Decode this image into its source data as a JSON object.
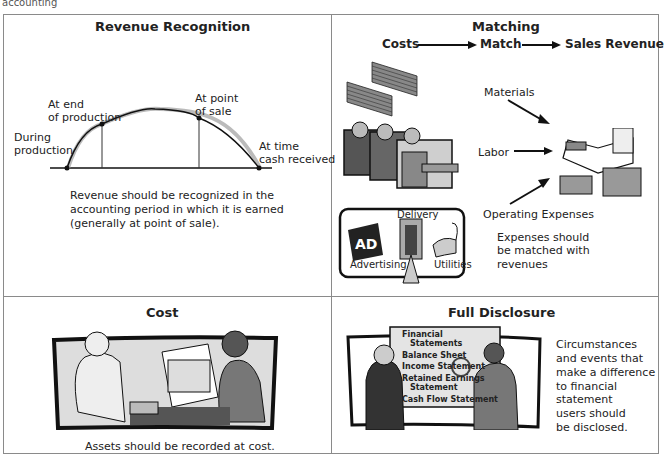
{
  "caption": "accounting",
  "revenue_recognition": {
    "title": "Revenue Recognition",
    "points": [
      "During production",
      "At end of production",
      "At point of sale",
      "At time cash received"
    ],
    "labels": {
      "during_1": "During",
      "during_2": "production",
      "end_1": "At end",
      "end_2": "of production",
      "sale_1": "At point",
      "sale_2": "of sale",
      "cash_1": "At time",
      "cash_2": "cash received"
    },
    "description": [
      "Revenue should be recognized  in the",
      "accounting period in which it is earned",
      "(generally at point of sale)."
    ]
  },
  "matching": {
    "title": "Matching",
    "flow": [
      "Costs",
      "Match",
      "Sales Revenue"
    ],
    "inputs": [
      "Materials",
      "Labor",
      "Operating Expenses"
    ],
    "expense_items": [
      "Delivery",
      "Advertising",
      "Utilities"
    ],
    "ad_sign": "AD",
    "description": [
      "Expenses should",
      "be matched with",
      "revenues"
    ]
  },
  "cost": {
    "title": "Cost",
    "description": "Assets should be recorded at cost."
  },
  "full_disclosure": {
    "title": "Full Disclosure",
    "board_items": [
      "Financial",
      "Statements",
      "Balance Sheet",
      "Income Statement",
      "Retained Earnings",
      "Statement",
      "Cash Flow Statement"
    ],
    "description": [
      "Circumstances",
      "and events that",
      "make a difference",
      "to financial",
      "statement",
      "users should",
      "be disclosed."
    ]
  }
}
